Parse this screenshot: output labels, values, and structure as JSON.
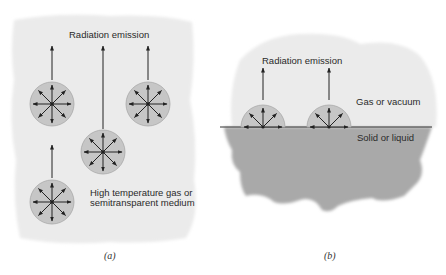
{
  "panel_a": {
    "title": "Radiation emission",
    "medium_label_line1": "High temperature gas or",
    "medium_label_line2": "semitransparent medium",
    "caption": "(a)"
  },
  "panel_b": {
    "title": "Radiation emission",
    "upper_region_label": "Gas or vacuum",
    "lower_region_label": "Solid or liquid",
    "caption": "(b)"
  },
  "colors": {
    "background_blob": "#ebebeb",
    "emitter_fill": "#c6c6c6",
    "solid_fill": "#a9a9a9",
    "arrow": "#222222"
  }
}
